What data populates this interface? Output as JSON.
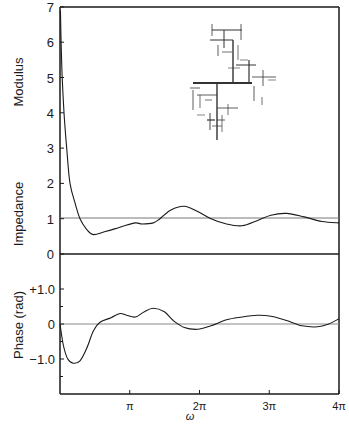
{
  "chart_data": [
    {
      "type": "line",
      "panel": "top",
      "title": "",
      "ylabel": "Impedance Modulus",
      "xlabel": "ω",
      "xlim": [
        0,
        12.566
      ],
      "ylim": [
        0,
        7
      ],
      "yticks": [
        "0",
        "1",
        "2",
        "3",
        "4",
        "5",
        "6",
        "7"
      ],
      "reference_line": 1,
      "series": [
        {
          "name": "Impedance modulus",
          "x": [
            0.02,
            0.05,
            0.1,
            0.18,
            0.3,
            0.45,
            0.7,
            0.9,
            1.2,
            1.5,
            2.0,
            2.5,
            2.9,
            3.4,
            3.7,
            4.2,
            4.5,
            5.0,
            5.6,
            6.2,
            6.8,
            7.5,
            8.2,
            8.9,
            9.5,
            10.2,
            11.0,
            11.8,
            12.566
          ],
          "y": [
            6.9,
            6.0,
            5.0,
            4.0,
            3.0,
            2.0,
            1.4,
            1.0,
            0.7,
            0.55,
            0.63,
            0.72,
            0.8,
            0.88,
            0.85,
            0.88,
            1.0,
            1.25,
            1.35,
            1.2,
            1.0,
            0.85,
            0.8,
            0.95,
            1.1,
            1.15,
            1.05,
            0.92,
            0.88
          ]
        }
      ]
    },
    {
      "type": "line",
      "panel": "bottom",
      "title": "",
      "ylabel": "Phase (rad)",
      "xlabel": "ω",
      "xlim": [
        0,
        12.566
      ],
      "ylim": [
        -2.0,
        1.75
      ],
      "yticks": [
        "-1.0",
        "0",
        "+1.0"
      ],
      "xticks": [
        "π",
        "2π",
        "3π",
        "4π"
      ],
      "reference_line": 0,
      "series": [
        {
          "name": "Phase",
          "x": [
            0,
            0.15,
            0.35,
            0.6,
            0.9,
            1.2,
            1.5,
            1.8,
            2.3,
            2.7,
            3.0,
            3.4,
            3.8,
            4.2,
            4.7,
            5.1,
            5.6,
            6.2,
            6.8,
            7.5,
            8.2,
            8.9,
            9.5,
            10.2,
            10.9,
            11.6,
            12.1,
            12.566
          ],
          "y": [
            0,
            -0.6,
            -1.0,
            -1.12,
            -1.05,
            -0.7,
            -0.2,
            0.05,
            0.18,
            0.3,
            0.25,
            0.2,
            0.35,
            0.45,
            0.35,
            0.1,
            -0.1,
            -0.15,
            -0.05,
            0.12,
            0.2,
            0.25,
            0.22,
            0.1,
            -0.05,
            -0.08,
            0.0,
            0.15
          ]
        }
      ]
    }
  ],
  "axes": {
    "top_ylabel_part1": "Modulus",
    "top_ylabel_part2": "Impedance",
    "bottom_ylabel": "Phase (rad)",
    "xlabel": "ω",
    "top_yticks": [
      {
        "label": "7",
        "value": 7
      },
      {
        "label": "6",
        "value": 6
      },
      {
        "label": "5",
        "value": 5
      },
      {
        "label": "4",
        "value": 4
      },
      {
        "label": "3",
        "value": 3
      },
      {
        "label": "2",
        "value": 2
      },
      {
        "label": "1",
        "value": 1
      },
      {
        "label": "0",
        "value": 0
      }
    ],
    "bottom_yticks": [
      {
        "label": "+1.0",
        "value": 1
      },
      {
        "label": "0",
        "value": 0
      },
      {
        "label": "−1.0",
        "value": -1
      }
    ],
    "xticks": [
      {
        "label": "π",
        "value": 1
      },
      {
        "label": "2π",
        "value": 2
      },
      {
        "label": "3π",
        "value": 3
      },
      {
        "label": "4π",
        "value": 4
      }
    ]
  },
  "inset": {
    "description": "branching tree network diagram"
  }
}
